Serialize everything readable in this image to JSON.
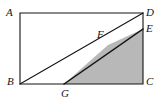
{
  "figure": {
    "type": "geometry-diagram",
    "canvas": {
      "width": 163,
      "height": 101,
      "background": "#ffffff"
    },
    "style": {
      "stroke_color": "#141414",
      "stroke_width": 1,
      "shade_fill": "#b8b8b8",
      "label_color": "#141414"
    },
    "labels": {
      "A": "A",
      "B": "B",
      "C": "C",
      "D": "D",
      "E": "E",
      "F": "F",
      "G": "G"
    },
    "points": {
      "A": {
        "x": 20,
        "y": 13
      },
      "D": {
        "x": 143,
        "y": 13
      },
      "C": {
        "x": 143,
        "y": 84
      },
      "B": {
        "x": 20,
        "y": 84
      },
      "E": {
        "x": 143,
        "y": 29
      },
      "G": {
        "x": 64,
        "y": 84
      },
      "F": {
        "x": 108,
        "y": 45
      }
    },
    "segments": [
      {
        "name": "side-AD",
        "from": "A",
        "to": "D"
      },
      {
        "name": "side-DC",
        "from": "D",
        "to": "C"
      },
      {
        "name": "side-CB",
        "from": "C",
        "to": "B"
      },
      {
        "name": "side-BA",
        "from": "B",
        "to": "A"
      },
      {
        "name": "diagonal-BD",
        "from": "B",
        "to": "D"
      },
      {
        "name": "segment-GE",
        "from": "G",
        "to": "E"
      }
    ],
    "shaded_region": {
      "name": "region-GCEF",
      "vertices": [
        "G",
        "C",
        "E",
        "F"
      ],
      "fill": "#b8b8b8"
    }
  }
}
